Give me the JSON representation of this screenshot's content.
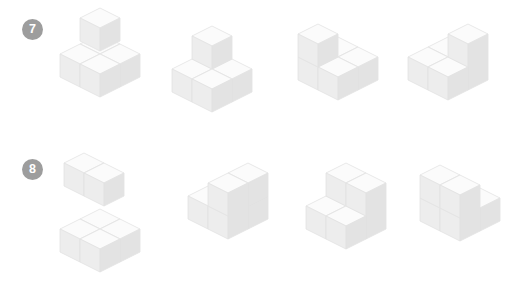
{
  "page": {
    "background_color": "#ffffff",
    "kind": "cube-counting-worksheet",
    "width": 526,
    "height": 298
  },
  "palette": {
    "face_top": "#fbfbfb",
    "face_left": "#ededed",
    "face_right": "#e3e3e3",
    "edge": "#e2e2e2",
    "badge_bg": "#9d9d9d",
    "badge_text": "#ffffff"
  },
  "geometry": {
    "cube_half_width": 20,
    "cube_height": 23
  },
  "rows": [
    {
      "id": "row-7",
      "badge_label": "7",
      "figures": [
        {
          "name": "figure-7-1",
          "x": 58,
          "y": 6,
          "cubes": [
            {
              "x": 0,
              "y": 0,
              "z": 0
            },
            {
              "x": 0,
              "y": 1,
              "z": 0
            },
            {
              "x": 1,
              "y": 0,
              "z": 0
            },
            {
              "x": 1,
              "y": 1,
              "z": 0
            },
            {
              "x": 1,
              "y": 1,
              "z": 2
            }
          ]
        },
        {
          "name": "figure-7-2",
          "x": 170,
          "y": 24,
          "cubes": [
            {
              "x": 0,
              "y": 0,
              "z": 0
            },
            {
              "x": 0,
              "y": 1,
              "z": 0
            },
            {
              "x": 1,
              "y": 0,
              "z": 0
            },
            {
              "x": 1,
              "y": 1,
              "z": 0
            },
            {
              "x": 0,
              "y": 0,
              "z": 1
            }
          ]
        },
        {
          "name": "figure-7-3",
          "x": 296,
          "y": 22,
          "cubes": [
            {
              "x": 0,
              "y": 0,
              "z": 0
            },
            {
              "x": 0,
              "y": 1,
              "z": 0
            },
            {
              "x": 1,
              "y": 0,
              "z": 0
            },
            {
              "x": 1,
              "y": 1,
              "z": 0
            },
            {
              "x": 0,
              "y": 1,
              "z": 1
            }
          ]
        },
        {
          "name": "figure-7-4",
          "x": 406,
          "y": 22,
          "cubes": [
            {
              "x": 0,
              "y": 0,
              "z": 0
            },
            {
              "x": 0,
              "y": 1,
              "z": 0
            },
            {
              "x": 1,
              "y": 0,
              "z": 0
            },
            {
              "x": 1,
              "y": 1,
              "z": 0
            },
            {
              "x": 1,
              "y": 0,
              "z": 1
            }
          ]
        }
      ]
    },
    {
      "id": "row-8",
      "badge_label": "8",
      "figures": [
        {
          "name": "figure-8-1-upper",
          "x": 62,
          "y": 2,
          "cubes": [
            {
              "x": 0,
              "y": 0,
              "z": 0
            },
            {
              "x": 1,
              "y": 0,
              "z": 0
            }
          ]
        },
        {
          "name": "figure-8-1-lower",
          "x": 58,
          "y": 58,
          "cubes": [
            {
              "x": 0,
              "y": 0,
              "z": 0
            },
            {
              "x": 0,
              "y": 1,
              "z": 0
            },
            {
              "x": 1,
              "y": 0,
              "z": 0
            },
            {
              "x": 1,
              "y": 1,
              "z": 0
            }
          ]
        },
        {
          "name": "figure-8-2",
          "x": 186,
          "y": 12,
          "cubes": [
            {
              "x": 0,
              "y": 0,
              "z": 0
            },
            {
              "x": 0,
              "y": 1,
              "z": 0
            },
            {
              "x": 1,
              "y": 0,
              "z": 0
            },
            {
              "x": 1,
              "y": 1,
              "z": 0
            },
            {
              "x": 1,
              "y": 0,
              "z": 1
            },
            {
              "x": 1,
              "y": 1,
              "z": 1
            }
          ]
        },
        {
          "name": "figure-8-3",
          "x": 304,
          "y": 12,
          "cubes": [
            {
              "x": 0,
              "y": 0,
              "z": 0
            },
            {
              "x": 0,
              "y": 1,
              "z": 0
            },
            {
              "x": 1,
              "y": 0,
              "z": 0
            },
            {
              "x": 1,
              "y": 1,
              "z": 0
            },
            {
              "x": 0,
              "y": 0,
              "z": 1
            },
            {
              "x": 1,
              "y": 0,
              "z": 1
            }
          ]
        },
        {
          "name": "figure-8-4",
          "x": 418,
          "y": 14,
          "cubes": [
            {
              "x": 0,
              "y": 0,
              "z": 0
            },
            {
              "x": 0,
              "y": 1,
              "z": 0
            },
            {
              "x": 1,
              "y": 0,
              "z": 0
            },
            {
              "x": 1,
              "y": 1,
              "z": 0
            },
            {
              "x": 0,
              "y": 1,
              "z": 1
            },
            {
              "x": 1,
              "y": 1,
              "z": 1
            }
          ]
        }
      ]
    }
  ]
}
